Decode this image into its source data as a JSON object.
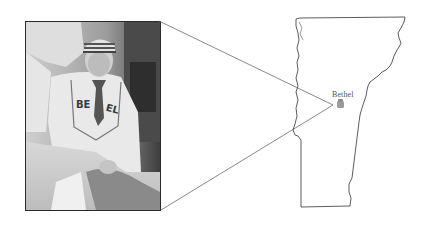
{
  "figure": {
    "photo": {
      "subject": "baseball-player-portrait",
      "jersey_text": "BETHEL",
      "style": "black-and-white"
    },
    "map": {
      "region": "Vermont outline",
      "marker": {
        "label": "Bethel",
        "icon": "town-marker-icon",
        "color": "#9a9a9a"
      }
    },
    "connector": {
      "color": "#6b6b6b"
    }
  }
}
